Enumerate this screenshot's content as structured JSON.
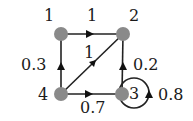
{
  "diagram": {
    "type": "markov-chain",
    "nodes": [
      {
        "id": "1",
        "label": "1"
      },
      {
        "id": "2",
        "label": "2"
      },
      {
        "id": "3",
        "label": "3"
      },
      {
        "id": "4",
        "label": "4"
      }
    ],
    "edges": [
      {
        "from": "1",
        "to": "2",
        "label": "1"
      },
      {
        "from": "2",
        "to": "4",
        "label": "1"
      },
      {
        "from": "4",
        "to": "1",
        "label": "0.3"
      },
      {
        "from": "4",
        "to": "3",
        "label": "0.7"
      },
      {
        "from": "3",
        "to": "2",
        "label": "0.2"
      },
      {
        "from": "3",
        "to": "3",
        "label": "0.8"
      }
    ],
    "colors": {
      "node": "#8a8a8a",
      "edge": "#222222",
      "text": "#1a1a1a"
    }
  }
}
